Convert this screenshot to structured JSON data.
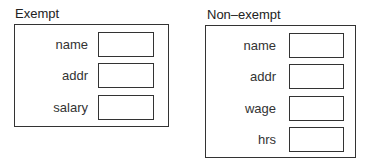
{
  "panels": [
    {
      "title": "Exempt",
      "fields": [
        {
          "label": "name",
          "value": ""
        },
        {
          "label": "addr",
          "value": ""
        },
        {
          "label": "salary",
          "value": ""
        }
      ]
    },
    {
      "title": "Non–exempt",
      "fields": [
        {
          "label": "name",
          "value": ""
        },
        {
          "label": "addr",
          "value": ""
        },
        {
          "label": "wage",
          "value": ""
        },
        {
          "label": "hrs",
          "value": ""
        }
      ]
    }
  ]
}
